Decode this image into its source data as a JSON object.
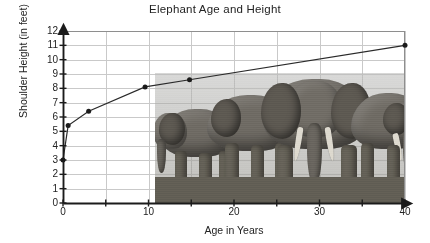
{
  "chart_data": {
    "type": "line",
    "title": "Elephant Age and Height",
    "xlabel": "Age in Years",
    "ylabel": "Shoulder Height (in feet)",
    "xlim": [
      0,
      40
    ],
    "ylim": [
      0,
      12
    ],
    "grid": true,
    "legend": "none",
    "x_tick_labels": [
      "0",
      "10",
      "20",
      "30",
      "40"
    ],
    "x_tick_values": [
      0,
      10,
      20,
      30,
      40
    ],
    "x_minor_tick_values": [
      5,
      15,
      25,
      35
    ],
    "y_tick_labels": [
      "0",
      "1",
      "2",
      "3",
      "4",
      "5",
      "6",
      "7",
      "8",
      "9",
      "10",
      "11",
      "12"
    ],
    "y_tick_values": [
      0,
      1,
      2,
      3,
      4,
      5,
      6,
      7,
      8,
      9,
      10,
      11,
      12
    ],
    "series": [
      {
        "name": "Shoulder height",
        "marker": "filled-circle",
        "points": [
          {
            "x": 0,
            "y": 3.0
          },
          {
            "x": 0.6,
            "y": 5.4
          },
          {
            "x": 3.0,
            "y": 6.4
          },
          {
            "x": 9.6,
            "y": 8.1
          },
          {
            "x": 14.8,
            "y": 8.6
          },
          {
            "x": 40,
            "y": 11.0
          }
        ]
      }
    ],
    "annotation_image": "photograph-of-elephant-herd"
  },
  "axis": {
    "line_color": "#1b1b1b",
    "grid_color": "#c9c9c9",
    "frame_color": "#8e8e8e"
  },
  "photo": {
    "caption": "elephant-herd-photo"
  }
}
